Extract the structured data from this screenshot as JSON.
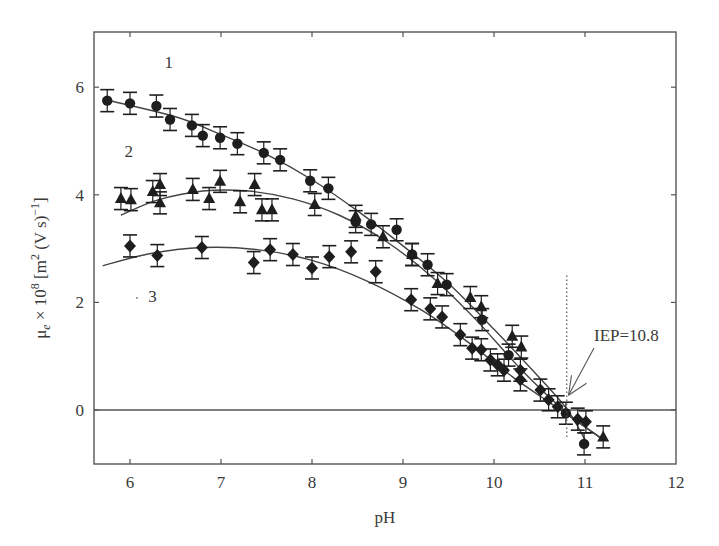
{
  "chart_data": {
    "type": "scatter",
    "title": "",
    "xlabel": "pH",
    "ylabel": "μe × 10^8 [m^2 (V s)^-1]",
    "ylabel_parts": {
      "mu": "μ",
      "sub": "e",
      "times": " × 10",
      "exp8": "8",
      "bracket": " [m",
      "exp2": "2",
      "mid": " (V s)",
      "expm1": "−1",
      "close": "]"
    },
    "xlim": [
      5.7,
      12
    ],
    "ylim": [
      -1.0,
      7.0
    ],
    "xticks": [
      6,
      7,
      8,
      9,
      10,
      11,
      12
    ],
    "yticks": [
      0,
      2,
      4,
      6
    ],
    "grid": false,
    "legend": "inline labels",
    "zero_line": true,
    "series": [
      {
        "name": "1",
        "marker": "circle",
        "label_pos": [
          6.38,
          6.35
        ],
        "points": [
          [
            5.75,
            5.75
          ],
          [
            6.0,
            5.7
          ],
          [
            6.29,
            5.65
          ],
          [
            6.44,
            5.4
          ],
          [
            6.68,
            5.29
          ],
          [
            6.8,
            5.1
          ],
          [
            6.99,
            5.06
          ],
          [
            7.18,
            4.95
          ],
          [
            7.47,
            4.78
          ],
          [
            7.65,
            4.65
          ],
          [
            7.98,
            4.26
          ],
          [
            8.18,
            4.12
          ],
          [
            8.48,
            3.5
          ],
          [
            8.65,
            3.45
          ],
          [
            8.93,
            3.35
          ],
          [
            9.1,
            2.89
          ],
          [
            9.27,
            2.7
          ],
          [
            9.48,
            2.33
          ],
          [
            9.87,
            1.68
          ],
          [
            10.16,
            1.02
          ],
          [
            10.79,
            -0.06
          ],
          [
            10.99,
            -0.63
          ]
        ],
        "fit": [
          [
            5.7,
            5.78
          ],
          [
            6.5,
            5.45
          ],
          [
            7.0,
            5.12
          ],
          [
            7.5,
            4.75
          ],
          [
            8.0,
            4.28
          ],
          [
            8.5,
            3.7
          ],
          [
            9.0,
            3.05
          ],
          [
            9.5,
            2.35
          ],
          [
            10.0,
            1.5
          ],
          [
            10.5,
            0.6
          ],
          [
            10.8,
            0.02
          ],
          [
            11.0,
            -0.55
          ]
        ]
      },
      {
        "name": "2",
        "marker": "triangle",
        "label_pos": [
          5.94,
          4.7
        ],
        "points": [
          [
            5.9,
            3.93
          ],
          [
            6.01,
            3.91
          ],
          [
            6.25,
            4.06
          ],
          [
            6.33,
            4.19
          ],
          [
            6.33,
            3.85
          ],
          [
            6.69,
            4.1
          ],
          [
            6.87,
            3.93
          ],
          [
            6.99,
            4.25
          ],
          [
            7.21,
            3.87
          ],
          [
            7.37,
            4.19
          ],
          [
            7.45,
            3.72
          ],
          [
            7.56,
            3.72
          ],
          [
            8.03,
            3.82
          ],
          [
            8.48,
            3.6
          ],
          [
            8.78,
            3.22
          ],
          [
            9.1,
            2.89
          ],
          [
            9.38,
            2.35
          ],
          [
            9.74,
            2.09
          ],
          [
            9.86,
            1.92
          ],
          [
            10.2,
            1.37
          ],
          [
            10.3,
            1.17
          ],
          [
            11.2,
            -0.5
          ]
        ],
        "fit": [
          [
            5.9,
            3.62
          ],
          [
            6.3,
            3.9
          ],
          [
            6.8,
            4.07
          ],
          [
            7.3,
            4.07
          ],
          [
            7.8,
            3.92
          ],
          [
            8.3,
            3.62
          ],
          [
            8.8,
            3.15
          ],
          [
            9.3,
            2.5
          ],
          [
            9.8,
            1.68
          ],
          [
            10.3,
            0.75
          ],
          [
            10.8,
            -0.05
          ],
          [
            11.2,
            -0.55
          ]
        ]
      },
      {
        "name": "3",
        "marker": "diamond",
        "label_pos": [
          6.2,
          2.0
        ],
        "points": [
          [
            6.0,
            3.05
          ],
          [
            6.3,
            2.87
          ],
          [
            6.79,
            3.02
          ],
          [
            7.36,
            2.74
          ],
          [
            7.54,
            2.98
          ],
          [
            7.79,
            2.89
          ],
          [
            8.0,
            2.64
          ],
          [
            8.19,
            2.85
          ],
          [
            8.43,
            2.94
          ],
          [
            8.7,
            2.57
          ],
          [
            9.09,
            2.05
          ],
          [
            9.3,
            1.88
          ],
          [
            9.43,
            1.73
          ],
          [
            9.63,
            1.4
          ],
          [
            9.76,
            1.15
          ],
          [
            9.86,
            1.12
          ],
          [
            9.96,
            0.93
          ],
          [
            10.04,
            0.84
          ],
          [
            10.11,
            0.74
          ],
          [
            10.29,
            0.74
          ],
          [
            10.29,
            0.56
          ],
          [
            10.51,
            0.37
          ],
          [
            10.6,
            0.19
          ],
          [
            10.7,
            0.06
          ],
          [
            10.92,
            -0.17
          ],
          [
            11.01,
            -0.22
          ]
        ],
        "fit": [
          [
            5.7,
            2.68
          ],
          [
            6.2,
            2.9
          ],
          [
            6.8,
            3.02
          ],
          [
            7.4,
            2.98
          ],
          [
            8.0,
            2.78
          ],
          [
            8.6,
            2.4
          ],
          [
            9.2,
            1.86
          ],
          [
            9.7,
            1.28
          ],
          [
            10.2,
            0.62
          ],
          [
            10.6,
            0.15
          ],
          [
            10.8,
            -0.08
          ],
          [
            11.2,
            -0.55
          ]
        ]
      }
    ],
    "annotations": [
      {
        "text": "IEP=10.8",
        "x": 10.82,
        "y": 1.4,
        "arrow_to": [
          10.83,
          0.2
        ]
      }
    ],
    "iep_line": {
      "x": 10.8,
      "y_from": -0.55,
      "y_to": 2.5
    }
  },
  "labels": {
    "xlabel": "pH",
    "iep": "IEP=10.8",
    "series1": "1",
    "series2": "2",
    "series3": "3"
  },
  "colors": {
    "ink": "#2a2a2a",
    "axis": "#555555",
    "marker": "#1e1e1e"
  }
}
